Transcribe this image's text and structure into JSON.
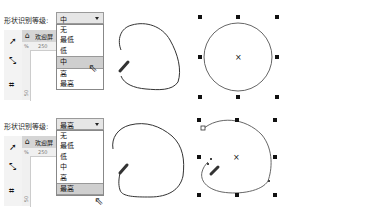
{
  "panels": [
    {
      "label": "形状识别等级:",
      "selected": "中",
      "options": [
        "无",
        "最低",
        "低",
        "中",
        "高",
        "最高"
      ],
      "highlighted_index": 3,
      "doc_tab": "欢迎屏",
      "ruler_unit": "%",
      "ruler_h_tick": "250",
      "ruler_v_tick": "50"
    },
    {
      "label": "形状识别等级:",
      "selected": "最高",
      "options": [
        "无",
        "最低",
        "低",
        "中",
        "高",
        "最高"
      ],
      "highlighted_index": 5,
      "doc_tab": "欢迎屏",
      "ruler_unit": "%",
      "ruler_h_tick": "250",
      "ruler_v_tick": "50"
    }
  ],
  "icons": {
    "pick_tool": "pick-tool-icon",
    "shape_tool": "shape-tool-icon",
    "crop_tool": "crop-tool-icon",
    "home": "home-icon",
    "cursor": "mouse-pointer-icon",
    "pencil": "pencil-icon"
  },
  "colors": {
    "stroke": "#333333",
    "dropdown_highlight": "#cfcfcf",
    "select_bg": "#e6e6e6"
  }
}
